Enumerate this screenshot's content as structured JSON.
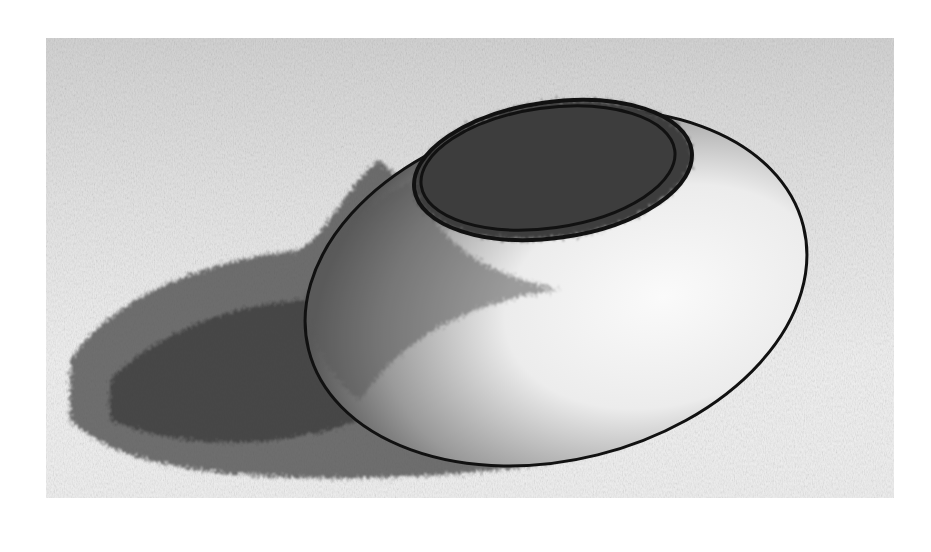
{
  "image": {
    "description": "Pencil drawing of a round bowl with a rim opening on top, shaded, casting a shadow to the left on a light textured background",
    "colors": {
      "page_background": "#ffffff",
      "paper_tone": "#d8d8d8",
      "shadow": "#3a3a3a",
      "outline": "#111111",
      "highlight": "#f2f2f2"
    }
  }
}
